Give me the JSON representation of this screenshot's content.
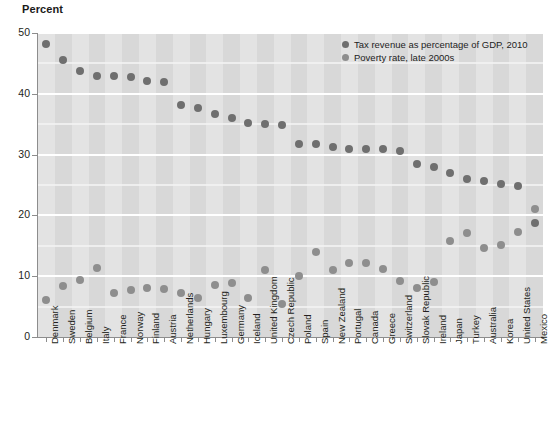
{
  "chart_data": {
    "type": "scatter",
    "title": "",
    "ylabel": "Percent",
    "xlabel": "",
    "ylim": [
      0,
      50
    ],
    "yticks": [
      0,
      10,
      20,
      30,
      40,
      50
    ],
    "yticklabels": [
      "0",
      "10",
      "20",
      "30",
      "40",
      "50"
    ],
    "minor_gridlines": [
      5,
      15,
      25,
      35,
      45
    ],
    "grid": true,
    "legend_position": "top-right",
    "categories": [
      "Denmark",
      "Sweden",
      "Belgium",
      "Italy",
      "France",
      "Norway",
      "Finland",
      "Austria",
      "Netherlands",
      "Hungary",
      "Luxembourg",
      "Germany",
      "Iceland",
      "United Kingdom",
      "Czech Republic",
      "Poland",
      "Spain",
      "New Zealand",
      "Portugal",
      "Canada",
      "Greece",
      "Switzerland",
      "Slovak Republic",
      "Ireland",
      "Japan",
      "Turkey",
      "Australia",
      "Korea",
      "United States",
      "Mexico"
    ],
    "series": [
      {
        "name": "Tax revenue as percentage of GDP, 2010",
        "color": "#6f6f6f",
        "values": [
          48.2,
          45.5,
          43.8,
          42.9,
          42.9,
          42.8,
          42.1,
          42.0,
          38.2,
          37.6,
          36.7,
          36.1,
          35.2,
          35.0,
          34.9,
          31.7,
          31.7,
          31.3,
          31.0,
          31.0,
          30.9,
          30.6,
          28.4,
          28.0,
          26.9,
          26.0,
          25.6,
          25.1,
          24.8,
          18.8
        ]
      },
      {
        "name": "Poverty rate, late  2000s",
        "color": "#8e8e8e",
        "values": [
          6.1,
          8.4,
          9.4,
          11.4,
          7.2,
          7.8,
          8.0,
          7.9,
          7.3,
          6.4,
          8.5,
          8.9,
          6.4,
          11.0,
          5.4,
          10.1,
          14.0,
          11.0,
          12.1,
          12.1,
          11.2,
          9.2,
          8.1,
          9.1,
          15.8,
          17.1,
          14.6,
          15.1,
          17.3,
          21.0
        ]
      }
    ]
  },
  "legend": {
    "entries": [
      "Tax revenue as percentage of GDP, 2010",
      "Poverty rate, late  2000s"
    ]
  },
  "axis": {
    "y_title": "Percent"
  }
}
